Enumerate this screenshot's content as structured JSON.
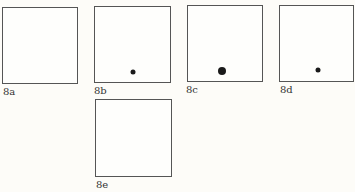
{
  "figure": {
    "panels": [
      {
        "id": "8a",
        "label": "8a",
        "dot": null
      },
      {
        "id": "8b",
        "label": "8b",
        "dot": {
          "size": "small"
        }
      },
      {
        "id": "8c",
        "label": "8c",
        "dot": {
          "size": "large"
        }
      },
      {
        "id": "8d",
        "label": "8d",
        "dot": {
          "size": "small"
        }
      },
      {
        "id": "8e",
        "label": "8e",
        "dot": null
      }
    ]
  }
}
